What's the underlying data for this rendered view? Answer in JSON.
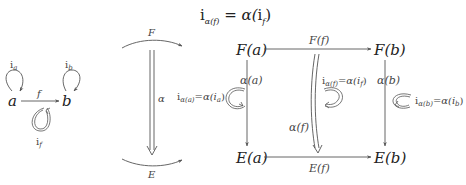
{
  "title": {
    "lhs_base": "i",
    "lhs_sub": "α(f)",
    "eq": " = ",
    "rhs_func": "α(",
    "rhs_base": "i",
    "rhs_sub": "f",
    "rhs_close": ")"
  },
  "left_diagram": {
    "object_a": "a",
    "object_b": "b",
    "arrow_f": "f",
    "loop_a_base": "i",
    "loop_a_sub": "a",
    "loop_b_base": "i",
    "loop_b_sub": "b",
    "loop_f_base": "i",
    "loop_f_sub": "f"
  },
  "middle_diagram": {
    "functor_top": "F",
    "functor_bottom": "E",
    "transformation": "α"
  },
  "right_diagram": {
    "Fa": "F(a)",
    "Fb": "F(b)",
    "Ea": "E(a)",
    "Eb": "E(b)",
    "Ff": "F(f)",
    "Ef": "E(f)",
    "alpha_a": "α(a)",
    "alpha_b": "α(b)",
    "alpha_f": "α(f)",
    "id_a_label": "i",
    "id_a_sub": "α(a)",
    "id_a_rhs": "=α(i",
    "id_a_rhs_sub": "a",
    "id_f_label": "i",
    "id_f_sub": "α(f)",
    "id_f_rhs": "=α(i",
    "id_f_rhs_sub": "f",
    "id_b_label": "i",
    "id_b_sub": "α(b)",
    "id_b_rhs": "=α(i",
    "id_b_rhs_sub": "b",
    "close_paren": ")"
  },
  "colors": {
    "stroke": "#555555",
    "text": "#222222"
  }
}
